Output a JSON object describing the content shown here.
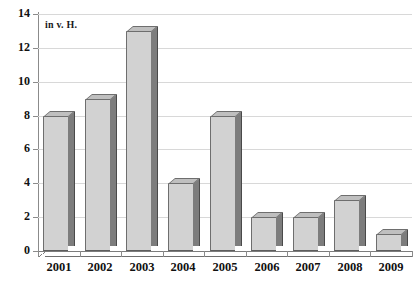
{
  "chart_data": {
    "type": "bar",
    "title": "",
    "subtitle": "",
    "unit_note": "in v. H.",
    "xlabel": "",
    "ylabel": "",
    "categories": [
      "2001",
      "2002",
      "2003",
      "2004",
      "2005",
      "2006",
      "2007",
      "2008",
      "2009"
    ],
    "values": [
      8,
      9,
      13,
      4,
      8,
      2,
      2,
      3,
      1
    ],
    "ylim": [
      0,
      14
    ],
    "ytick_values": [
      0,
      2,
      4,
      6,
      8,
      10,
      12,
      14
    ],
    "ytick_labels": [
      "0",
      "2",
      "4",
      "6",
      "8",
      "10",
      "12",
      "14"
    ],
    "grid": true,
    "legend": null,
    "series": [
      {
        "name": "in v. H.",
        "values": [
          8,
          9,
          13,
          4,
          8,
          2,
          2,
          3,
          1
        ]
      }
    ],
    "style": {
      "bar_face_color": "#d2d2d2",
      "bar_side_color": "#7d7d7d",
      "bar_top_color": "#bfbfbf",
      "bar_outline_color": "#6e6e6e",
      "gridline_color": "#d8d8d8",
      "axis_color": "#8b8b8b",
      "text_color": "#111111",
      "background_color": "#ffffff"
    }
  }
}
